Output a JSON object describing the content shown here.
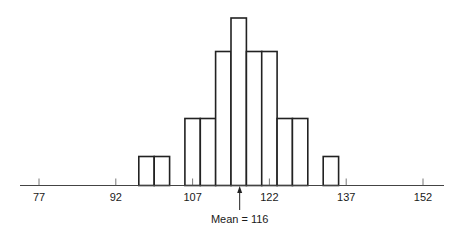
{
  "chart_data": {
    "type": "bar",
    "subtype": "histogram",
    "title": "",
    "xlabel": "",
    "ylabel": "",
    "x_ticks": [
      77,
      92,
      107,
      122,
      137,
      152
    ],
    "xlim": [
      73,
      156
    ],
    "bin_width": 3,
    "bins": [
      {
        "start": 96.5,
        "end": 99.5,
        "count": 1
      },
      {
        "start": 99.5,
        "end": 102.5,
        "count": 1
      },
      {
        "start": 102.5,
        "end": 105.5,
        "count": 0
      },
      {
        "start": 105.5,
        "end": 108.5,
        "count": 2
      },
      {
        "start": 108.5,
        "end": 111.5,
        "count": 2
      },
      {
        "start": 111.5,
        "end": 114.5,
        "count": 4
      },
      {
        "start": 114.5,
        "end": 117.5,
        "count": 5
      },
      {
        "start": 117.5,
        "end": 120.5,
        "count": 4
      },
      {
        "start": 120.5,
        "end": 123.5,
        "count": 4
      },
      {
        "start": 123.5,
        "end": 126.5,
        "count": 2
      },
      {
        "start": 126.5,
        "end": 129.5,
        "count": 2
      },
      {
        "start": 129.5,
        "end": 132.5,
        "count": 0
      },
      {
        "start": 132.5,
        "end": 135.5,
        "count": 1
      }
    ],
    "grid": false,
    "legend": null,
    "annotations": [
      {
        "type": "arrow",
        "x": 116,
        "label": "Mean = 116"
      }
    ]
  },
  "labels": {
    "ticks": [
      "77",
      "92",
      "107",
      "122",
      "137",
      "152"
    ],
    "mean": "Mean = 116"
  },
  "colors": {
    "bar_fill": "#ffffff",
    "bar_stroke": "#222222",
    "axis": "#444444",
    "text": "#1a1a1a"
  }
}
